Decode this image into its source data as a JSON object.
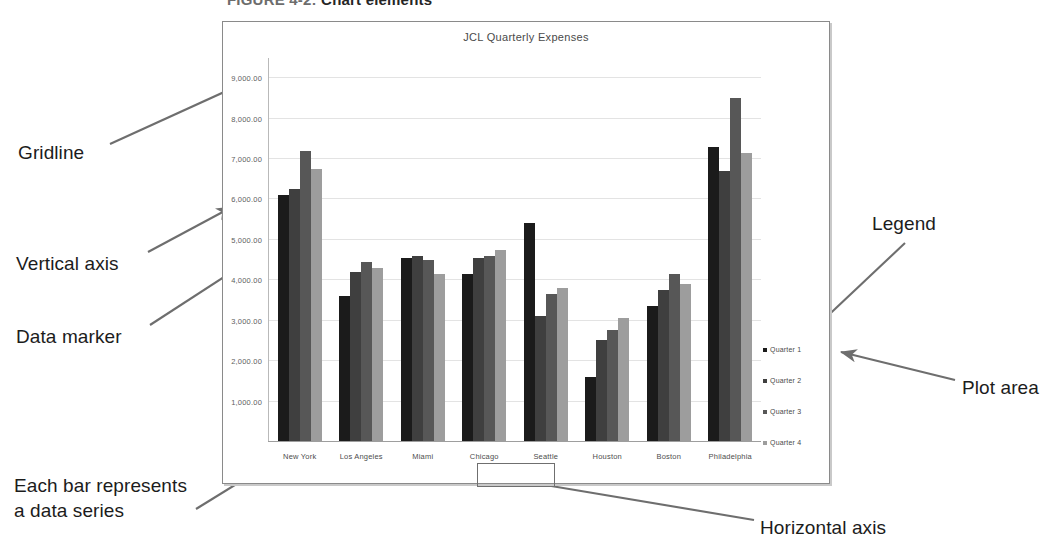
{
  "figure": {
    "number": "FIGURE 4-2:",
    "title": "Chart elements"
  },
  "annotations": {
    "gridline": "Gridline",
    "vertical_axis": "Vertical axis",
    "data_marker": "Data marker",
    "data_series": "Each bar represents\na data series",
    "legend": "Legend",
    "plot_area": "Plot area",
    "horizontal_axis": "Horizontal axis"
  },
  "colors": {
    "q1": "#1b1b1b",
    "q2": "#3f3f3f",
    "q3": "#575757",
    "q4": "#9d9d9d",
    "gridline": "#e3e3e3",
    "frame": "#8a8a8a"
  },
  "chart_data": {
    "type": "bar",
    "title": "JCL Quarterly Expenses",
    "xlabel": "",
    "ylabel": "",
    "ylim": [
      0,
      9500
    ],
    "ytick_values": [
      1000,
      2000,
      3000,
      4000,
      5000,
      6000,
      7000,
      8000,
      9000
    ],
    "ytick_labels": [
      "1,000.00",
      "2,000.00",
      "3,000.00",
      "4,000.00",
      "5,000.00",
      "6,000.00",
      "7,000.00",
      "8,000.00",
      "9,000.00"
    ],
    "grid": true,
    "legend_position": "right",
    "categories": [
      "New York",
      "Los Angeles",
      "Miami",
      "Chicago",
      "Seattle",
      "Houston",
      "Boston",
      "Philadelphia"
    ],
    "series": [
      {
        "name": "Quarter 1",
        "values": [
          6100,
          3600,
          4550,
          4150,
          5400,
          1600,
          3350,
          7300
        ]
      },
      {
        "name": "Quarter 2",
        "values": [
          6250,
          4200,
          4600,
          4550,
          3100,
          2500,
          3750,
          6700
        ]
      },
      {
        "name": "Quarter 3",
        "values": [
          7200,
          4450,
          4500,
          4600,
          3650,
          2750,
          4150,
          8500
        ]
      },
      {
        "name": "Quarter 4",
        "values": [
          6750,
          4300,
          4150,
          4750,
          3800,
          3050,
          3900,
          7150
        ]
      }
    ]
  }
}
